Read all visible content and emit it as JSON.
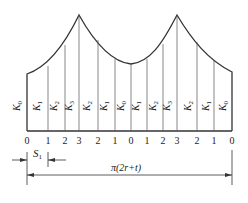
{
  "diagram": {
    "title": "",
    "stroke_color": "#333333",
    "station_labels": [
      "0",
      "1",
      "2",
      "3",
      "2",
      "1",
      "0",
      "1",
      "2",
      "3",
      "2",
      "1",
      "0"
    ],
    "coefficient_labels": [
      {
        "letter": "K",
        "sub": "0"
      },
      {
        "letter": "K",
        "sub": "1"
      },
      {
        "letter": "K",
        "sub": "2"
      },
      {
        "letter": "K",
        "sub": "3"
      },
      {
        "letter": "K",
        "sub": "2"
      },
      {
        "letter": "K",
        "sub": "1"
      },
      {
        "letter": "K",
        "sub": "0"
      },
      {
        "letter": "K",
        "sub": "1"
      },
      {
        "letter": "K",
        "sub": "2"
      },
      {
        "letter": "K",
        "sub": "3"
      },
      {
        "letter": "K",
        "sub": "2"
      },
      {
        "letter": "K",
        "sub": "1"
      },
      {
        "letter": "K",
        "sub": "0"
      }
    ],
    "dimension_s1": {
      "letter": "S",
      "sub": "1"
    },
    "dimension_total": "π(2r+t)"
  }
}
